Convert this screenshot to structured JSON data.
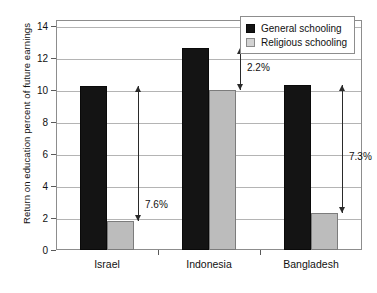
{
  "chart_data": {
    "type": "bar",
    "title": "",
    "xlabel": "",
    "ylabel": "Return on education percent of future earnings",
    "categories": [
      "Israel",
      "Indonesia",
      "Bangladesh"
    ],
    "series": [
      {
        "name": "General schooling",
        "color": "#141414",
        "values": [
          10.25,
          12.6,
          10.3
        ]
      },
      {
        "name": "Religious schooling",
        "color": "#bcbcbc",
        "values": [
          1.8,
          10.0,
          2.3
        ]
      }
    ],
    "ylim": [
      0,
      15
    ],
    "yticks": [
      0,
      2,
      4,
      6,
      8,
      10,
      12,
      14
    ],
    "ytick_labels": [
      "0",
      "2",
      "4",
      "6",
      "8",
      "10",
      "12",
      "14"
    ],
    "grid": true,
    "legend_position": "top-right",
    "annotations": [
      {
        "category": "Israel",
        "label": "7.6%",
        "from": 10.25,
        "to": 1.8
      },
      {
        "category": "Indonesia",
        "label": "2.2%",
        "from": 12.6,
        "to": 10.0
      },
      {
        "category": "Bangladesh",
        "label": "7.3%",
        "from": 10.3,
        "to": 2.3
      }
    ]
  },
  "legend": {
    "items": [
      {
        "label": "General schooling",
        "swatch": "general"
      },
      {
        "label": "Religious schooling",
        "swatch": "religious"
      }
    ]
  }
}
